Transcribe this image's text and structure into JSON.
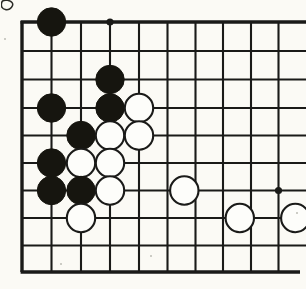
{
  "app": {
    "title": "Go Board Diagram",
    "type": "go-game-position"
  },
  "board": {
    "name": "go-board",
    "style": "corner-diagram",
    "background_color": "#fbfaf5",
    "line_color": "#1a1a18",
    "black_stone_color": "#16150f",
    "white_stone_color": "#fdfdfa",
    "white_stone_outline_color": "#1a1a18",
    "line_width": 2.1,
    "edge_line_width": 3.4,
    "stone_radius": 14.2,
    "columns_x": [
      22,
      51.5,
      81,
      110,
      139,
      167.5,
      195.5,
      223,
      251,
      278.5
    ],
    "rows_y": [
      22,
      51,
      79.5,
      108,
      135.5,
      163,
      190.5,
      218,
      245.5,
      272
    ],
    "visible_columns": 10,
    "visible_rows": 10,
    "clipped_edges": [
      "right",
      "bottom-partial"
    ],
    "left_edge_is_board_border": true,
    "top_edge_is_board_border": true,
    "bottom_edge_is_board_border": true
  },
  "star_points": [
    {
      "name": "hoshi-top-left-area",
      "col": 3,
      "row": 0
    },
    {
      "name": "hoshi-right-lower",
      "col": 9,
      "row": 6
    }
  ],
  "stones": [
    {
      "name": "black-stone-c2-r1",
      "color": "black",
      "col": 1,
      "row": 0
    },
    {
      "name": "black-stone-c4-r3",
      "color": "black",
      "col": 3,
      "row": 2
    },
    {
      "name": "black-stone-c2-r4",
      "color": "black",
      "col": 1,
      "row": 3
    },
    {
      "name": "black-stone-c4-r4",
      "color": "black",
      "col": 3,
      "row": 3
    },
    {
      "name": "white-stone-c5-r4",
      "color": "white",
      "col": 4,
      "row": 3
    },
    {
      "name": "black-stone-c3-r5",
      "color": "black",
      "col": 2,
      "row": 4
    },
    {
      "name": "white-stone-c4-r5",
      "color": "white",
      "col": 3,
      "row": 4
    },
    {
      "name": "white-stone-c5-r5",
      "color": "white",
      "col": 4,
      "row": 4
    },
    {
      "name": "black-stone-c2-r6",
      "color": "black",
      "col": 1,
      "row": 5
    },
    {
      "name": "white-stone-c3-r6",
      "color": "white",
      "col": 2,
      "row": 5
    },
    {
      "name": "white-stone-c4-r6",
      "color": "white",
      "col": 3,
      "row": 5
    },
    {
      "name": "black-stone-c2-r7",
      "color": "black",
      "col": 1,
      "row": 6
    },
    {
      "name": "black-stone-c3-r7",
      "color": "black",
      "col": 2,
      "row": 6
    },
    {
      "name": "white-stone-c4-r7",
      "color": "white",
      "col": 3,
      "row": 6
    },
    {
      "name": "white-stone-c6-r7",
      "color": "white",
      "col": 5.6,
      "row": 6
    },
    {
      "name": "white-stone-c3-r8",
      "color": "white",
      "col": 2,
      "row": 7
    },
    {
      "name": "white-stone-c8-r8",
      "color": "white",
      "col": 7.6,
      "row": 7
    },
    {
      "name": "white-stone-c10-r8",
      "color": "white",
      "col": 9.6,
      "row": 7
    }
  ],
  "stone_counts": {
    "black": 8,
    "white": 10,
    "total": 18
  },
  "artifacts": {
    "paper_specks": [
      {
        "x": 4,
        "y": 38,
        "size": 2
      },
      {
        "x": 150,
        "y": 255,
        "size": 2
      },
      {
        "x": 60,
        "y": 263,
        "size": 2
      },
      {
        "x": 296,
        "y": 212,
        "size": 2
      }
    ],
    "corner_scan_mark": "partial-ink-blob-top-left"
  }
}
